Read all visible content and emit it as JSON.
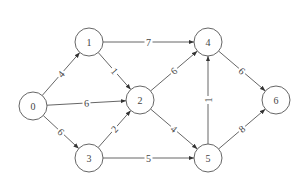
{
  "diagram": {
    "type": "weighted-directed-graph",
    "nodes": [
      {
        "id": "0",
        "label": "0",
        "x": 33,
        "y": 106
      },
      {
        "id": "1",
        "label": "1",
        "x": 89,
        "y": 42
      },
      {
        "id": "2",
        "label": "2",
        "x": 140,
        "y": 100
      },
      {
        "id": "3",
        "label": "3",
        "x": 89,
        "y": 158
      },
      {
        "id": "4",
        "label": "4",
        "x": 208,
        "y": 42
      },
      {
        "id": "5",
        "label": "5",
        "x": 208,
        "y": 158
      },
      {
        "id": "6",
        "label": "6",
        "x": 276,
        "y": 100
      }
    ],
    "edges": [
      {
        "from": "0",
        "to": "1",
        "weight": "4"
      },
      {
        "from": "0",
        "to": "2",
        "weight": "6"
      },
      {
        "from": "0",
        "to": "3",
        "weight": "6"
      },
      {
        "from": "1",
        "to": "2",
        "weight": "1"
      },
      {
        "from": "1",
        "to": "4",
        "weight": "7"
      },
      {
        "from": "3",
        "to": "2",
        "weight": "2"
      },
      {
        "from": "3",
        "to": "5",
        "weight": "5"
      },
      {
        "from": "2",
        "to": "4",
        "weight": "6"
      },
      {
        "from": "2",
        "to": "5",
        "weight": "4"
      },
      {
        "from": "5",
        "to": "4",
        "weight": "1"
      },
      {
        "from": "4",
        "to": "6",
        "weight": "6"
      },
      {
        "from": "5",
        "to": "6",
        "weight": "8"
      }
    ],
    "node_radius": 14,
    "colors": {
      "stroke": "#555555",
      "text": "#444444",
      "background": "#ffffff"
    }
  }
}
